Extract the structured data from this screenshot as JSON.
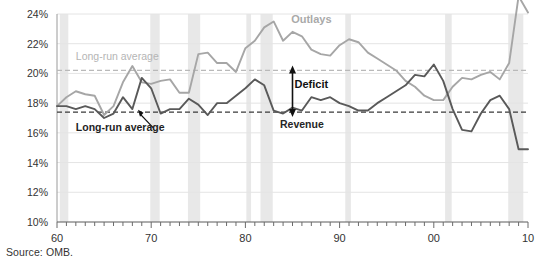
{
  "figure": {
    "source_note": "Source: OMB."
  },
  "chart_data": {
    "type": "line",
    "title": "",
    "xlabel": "",
    "ylabel": "",
    "xlim": [
      1960,
      2010
    ],
    "ylim": [
      10,
      24
    ],
    "grid": true,
    "legend": "inline-annotations",
    "y_ticks": [
      "10%",
      "12%",
      "14%",
      "16%",
      "18%",
      "20%",
      "22%",
      "24%"
    ],
    "y_tick_values": [
      10,
      12,
      14,
      16,
      18,
      20,
      22,
      24
    ],
    "x_ticks": [
      "60",
      "70",
      "80",
      "90",
      "00",
      "10"
    ],
    "x_tick_values": [
      1960,
      1970,
      1980,
      1990,
      2000,
      2010
    ],
    "x_minor_tick_step": 1,
    "x": [
      1960,
      1961,
      1962,
      1963,
      1964,
      1965,
      1966,
      1967,
      1968,
      1969,
      1970,
      1971,
      1972,
      1973,
      1974,
      1975,
      1976,
      1977,
      1978,
      1979,
      1980,
      1981,
      1982,
      1983,
      1984,
      1985,
      1986,
      1987,
      1988,
      1989,
      1990,
      1991,
      1992,
      1993,
      1994,
      1995,
      1996,
      1997,
      1998,
      1999,
      2000,
      2001,
      2002,
      2003,
      2004,
      2005,
      2006,
      2007,
      2008,
      2009,
      2010
    ],
    "series": [
      {
        "name": "Outlays",
        "color": "#a6a6a6",
        "values": [
          17.8,
          18.4,
          18.8,
          18.6,
          18.5,
          17.2,
          17.8,
          19.4,
          20.5,
          19.4,
          19.3,
          19.5,
          19.6,
          18.7,
          18.7,
          21.3,
          21.4,
          20.7,
          20.7,
          20.1,
          21.7,
          22.2,
          23.1,
          23.5,
          22.2,
          22.8,
          22.5,
          21.6,
          21.3,
          21.2,
          21.9,
          22.3,
          22.1,
          21.4,
          21.0,
          20.6,
          20.2,
          19.5,
          19.1,
          18.5,
          18.2,
          18.2,
          19.1,
          19.7,
          19.6,
          19.9,
          20.1,
          19.6,
          20.7,
          25.2,
          24.1
        ],
        "long_run_average": 20.2,
        "long_run_average_label": "Long-run average"
      },
      {
        "name": "Revenue",
        "color": "#595959",
        "values": [
          17.8,
          17.8,
          17.6,
          17.8,
          17.6,
          17.0,
          17.3,
          18.4,
          17.6,
          19.7,
          19.0,
          17.3,
          17.6,
          17.6,
          18.3,
          17.9,
          17.2,
          18.0,
          18.0,
          18.5,
          19.0,
          19.6,
          19.2,
          17.5,
          17.3,
          17.7,
          17.5,
          18.4,
          18.2,
          18.4,
          18.0,
          17.8,
          17.5,
          17.5,
          18.0,
          18.4,
          18.8,
          19.2,
          19.9,
          19.8,
          20.6,
          19.5,
          17.6,
          16.2,
          16.1,
          17.3,
          18.2,
          18.5,
          17.6,
          14.9,
          14.9
        ],
        "long_run_average": 17.4,
        "long_run_average_label": "Long-run average"
      }
    ],
    "annotations": [
      {
        "name": "outlays-label",
        "text": "Outlays",
        "x": 1987,
        "y": 23.4
      },
      {
        "name": "revenue-label",
        "text": "Revenue",
        "x": 1986,
        "y": 16.3
      },
      {
        "name": "deficit-label",
        "text": "Deficit",
        "x": 1987,
        "y": 19.0
      },
      {
        "name": "deficit-arrow",
        "text": "",
        "from_y": 20.2,
        "to_y": 17.4,
        "x": 1985
      },
      {
        "name": "long-run-average-outlays",
        "text": "Long-run average",
        "x": 1962,
        "y": 20.9
      },
      {
        "name": "long-run-average-revenue",
        "text": "Long-run average",
        "x": 1962,
        "y": 16.1
      }
    ],
    "recession_bands": [
      {
        "start": 1960.3,
        "end": 1961.2
      },
      {
        "start": 1969.9,
        "end": 1970.9
      },
      {
        "start": 1973.9,
        "end": 1975.2
      },
      {
        "start": 1980.1,
        "end": 1980.6
      },
      {
        "start": 1981.6,
        "end": 1982.9
      },
      {
        "start": 1990.6,
        "end": 1991.2
      },
      {
        "start": 2001.2,
        "end": 2001.9
      },
      {
        "start": 2007.9,
        "end": 2009.5
      }
    ]
  }
}
